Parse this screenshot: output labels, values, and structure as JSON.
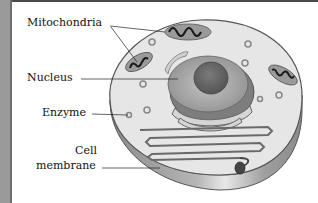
{
  "diagram": {
    "labels": {
      "mitochondria": "Mitochondria",
      "nucleus": "Nucleus",
      "enzyme": "Enzyme",
      "cell_line1": "Cell",
      "cell_line2": "membrane"
    },
    "colors": {
      "cytoplasm": "#e6e6e6",
      "membrane_side": "#9c9c9c",
      "nucleus": "#a8a8a8",
      "nucleolus": "#6a6a6a",
      "mitochondria": "#8a8a8a",
      "outline": "#555555"
    }
  }
}
